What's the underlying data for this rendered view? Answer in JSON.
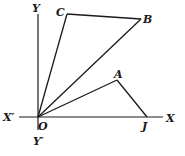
{
  "diagram": {
    "labels": {
      "Y": "Y",
      "Y_prime": "Y′",
      "X": "X",
      "X_prime": "X′",
      "O": "O",
      "A": "A",
      "B": "B",
      "C": "C",
      "J": "J"
    },
    "stroke_color": "#1a1a1a"
  }
}
